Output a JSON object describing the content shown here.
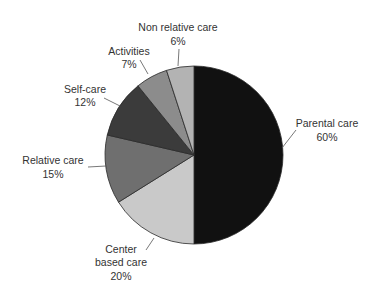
{
  "chart_data": {
    "type": "pie",
    "title": "",
    "categories": [
      "Parental care",
      "Center based care",
      "Relative care",
      "Self-care",
      "Activities",
      "Non relative care"
    ],
    "values": [
      60,
      20,
      15,
      12,
      7,
      6
    ],
    "value_labels": [
      "60%",
      "20%",
      "15%",
      "12%",
      "7%",
      "6%"
    ],
    "legend": "none (labels placed beside slices with leader lines)",
    "slices": [
      {
        "name": "Parental care",
        "label_lines": [
          "Parental care",
          "60%"
        ],
        "value": 60,
        "color": "#111111",
        "start_deg": 0,
        "end_deg": 180
      },
      {
        "name": "Center based care",
        "label_lines": [
          "Center",
          "based care",
          "20%"
        ],
        "value": 20,
        "color": "#c9c9c9",
        "start_deg": 180,
        "end_deg": 238
      },
      {
        "name": "Relative care",
        "label_lines": [
          "Relative care",
          "15%"
        ],
        "value": 15,
        "color": "#6f6f6f",
        "start_deg": 238,
        "end_deg": 283
      },
      {
        "name": "Self-care",
        "label_lines": [
          "Self-care",
          "12%"
        ],
        "value": 12,
        "color": "#3b3b3b",
        "start_deg": 283,
        "end_deg": 321
      },
      {
        "name": "Activities",
        "label_lines": [
          "Activities",
          "7%"
        ],
        "value": 7,
        "color": "#8c8c8c",
        "start_deg": 321,
        "end_deg": 342
      },
      {
        "name": "Non relative care",
        "label_lines": [
          "Non relative care",
          "6%"
        ],
        "value": 6,
        "color": "#b3b3b3",
        "start_deg": 342,
        "end_deg": 360
      }
    ]
  },
  "labels": {
    "parental": {
      "line1": "Parental care",
      "line2": "60%"
    },
    "center": {
      "line1": "Center",
      "line2": "based care",
      "line3": "20%"
    },
    "relative": {
      "line1": "Relative care",
      "line2": "15%"
    },
    "selfcare": {
      "line1": "Self-care",
      "line2": "12%"
    },
    "activities": {
      "line1": "Activities",
      "line2": "7%"
    },
    "nonrelative": {
      "line1": "Non relative care",
      "line2": "6%"
    }
  }
}
